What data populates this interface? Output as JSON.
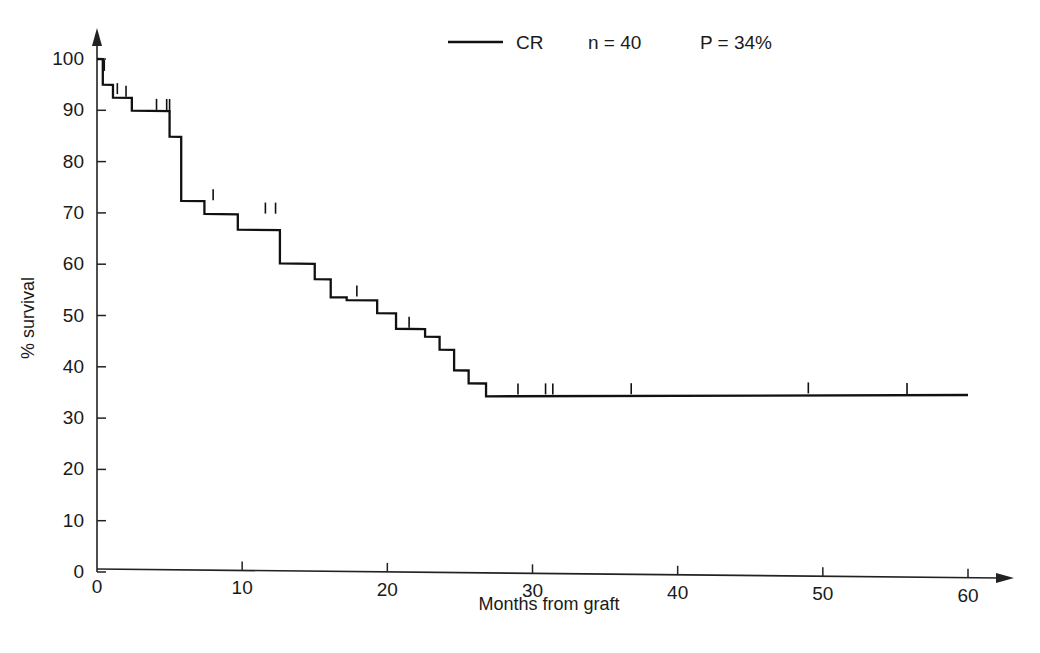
{
  "chart_data": {
    "type": "line",
    "title": "",
    "subtitle": "",
    "xlabel": "Months from graft",
    "ylabel": "% survival",
    "xlim": [
      0,
      60
    ],
    "ylim": [
      0,
      100
    ],
    "xticks": [
      0,
      10,
      20,
      30,
      40,
      50,
      60
    ],
    "yticks": [
      0,
      10,
      20,
      30,
      40,
      50,
      60,
      70,
      80,
      90,
      100
    ],
    "xtick_labels": [
      "0",
      "10",
      "20",
      "30",
      "40",
      "50",
      "60"
    ],
    "ytick_labels": [
      "0",
      "10",
      "20",
      "30",
      "40",
      "50",
      "60",
      "70",
      "80",
      "90",
      "100"
    ],
    "grid": false,
    "legend_position": "top-center",
    "series": [
      {
        "name": "CR",
        "n": 40,
        "n_label": "n = 40",
        "p_label": "P = 34%",
        "plot_style": "kaplan-meier-step",
        "color": "#111111",
        "x": [
          0.0,
          0.4,
          0.4,
          1.1,
          1.1,
          2.4,
          2.4,
          5.0,
          5.0,
          5.8,
          5.8,
          7.4,
          7.4,
          9.7,
          9.7,
          12.6,
          12.6,
          15.0,
          15.0,
          16.1,
          16.1,
          17.2,
          17.2,
          19.3,
          19.3,
          20.6,
          20.6,
          22.6,
          22.6,
          23.6,
          23.6,
          24.6,
          24.6,
          25.6,
          25.6,
          26.8,
          26.8,
          60.0
        ],
        "y": [
          100.0,
          100.0,
          95.0,
          95.0,
          92.5,
          92.5,
          90.0,
          90.0,
          85.0,
          85.0,
          72.5,
          72.5,
          70.0,
          70.0,
          67.0,
          67.0,
          60.5,
          60.5,
          57.5,
          57.5,
          54.0,
          54.0,
          53.5,
          53.5,
          51.0,
          51.0,
          48.0,
          48.0,
          46.5,
          46.5,
          44.0,
          44.0,
          40.0,
          40.0,
          37.5,
          37.5,
          35.0,
          36.2
        ]
      }
    ],
    "censored_points": [
      {
        "x": 0.5,
        "y": 97.5
      },
      {
        "x": 1.4,
        "y": 93.0
      },
      {
        "x": 2.0,
        "y": 92.5
      },
      {
        "x": 4.1,
        "y": 90.0
      },
      {
        "x": 4.8,
        "y": 90.0
      },
      {
        "x": 5.0,
        "y": 90.0
      },
      {
        "x": 8.0,
        "y": 72.5
      },
      {
        "x": 11.6,
        "y": 70.0
      },
      {
        "x": 12.3,
        "y": 70.0
      },
      {
        "x": 17.9,
        "y": 54.0
      },
      {
        "x": 21.5,
        "y": 48.0
      },
      {
        "x": 29.0,
        "y": 35.2
      },
      {
        "x": 30.9,
        "y": 35.3
      },
      {
        "x": 31.4,
        "y": 35.3
      },
      {
        "x": 36.8,
        "y": 35.5
      },
      {
        "x": 49.0,
        "y": 36.0
      },
      {
        "x": 55.8,
        "y": 36.1
      }
    ],
    "annotations": []
  },
  "legend": {
    "series_label": "CR",
    "n_label": "n = 40",
    "p_label": "P = 34%",
    "n_italic_part": "n",
    "n_value_part": " = 40"
  },
  "axes": {
    "x_title": "Months from graft",
    "y_title": "% survival"
  },
  "colors": {
    "curve": "#111111",
    "axis": "#222222",
    "background": "#ffffff",
    "text": "#1a1a1a"
  }
}
